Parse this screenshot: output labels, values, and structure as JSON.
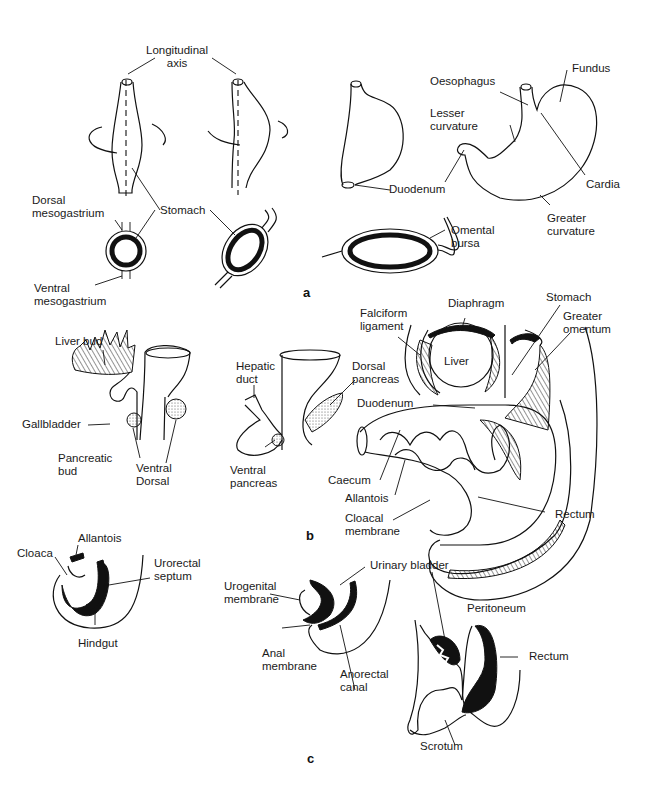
{
  "figure": {
    "panels": [
      {
        "id": "a",
        "label": "a",
        "topic": "Rotation of the stomach",
        "labels": {
          "longitudinal_axis": "Longitudinal\naxis",
          "stomach": "Stomach",
          "dorsal_mesogastrium": "Dorsal\nmesogastrium",
          "ventral_mesogastrium": "Ventral\nmesogastrium",
          "duodenum": "Duodenum",
          "omental_bursa": "Omental\nbursa",
          "oesophagus": "Oesophagus",
          "fundus": "Fundus",
          "lesser_curvature": "Lesser\ncurvature",
          "cardia": "Cardia",
          "greater_curvature": "Greater\ncurvature"
        }
      },
      {
        "id": "b",
        "label": "b",
        "topic": "Liver, pancreas and midgut development",
        "labels": {
          "liver_bud": "Liver bud",
          "gallbladder": "Gallbladder",
          "pancreatic_bud": "Pancreatic\nbud",
          "ventral_dorsal": "Ventral\nDorsal",
          "hepatic_duct": "Hepatic\nduct",
          "ventral_pancreas": "Ventral\npancreas",
          "dorsal_pancreas": "Dorsal\npancreas",
          "falciform_ligament": "Falciform\nligament",
          "diaphragm": "Diaphragm",
          "stomach": "Stomach",
          "greater_omentum": "Greater\nomentum",
          "liver": "Liver",
          "duodenum": "Duodenum",
          "caecum": "Caecum",
          "allantois": "Allantois",
          "cloacal_membrane": "Cloacal\nmembrane",
          "rectum": "Rectum"
        }
      },
      {
        "id": "c",
        "label": "c",
        "topic": "Division of the cloaca",
        "labels": {
          "allantois": "Allantois",
          "cloaca": "Cloaca",
          "urorectal_septum": "Urorectal\nseptum",
          "hindgut": "Hindgut",
          "urogenital_membrane": "Urogenital\nmembrane",
          "urinary_bladder": "Urinary bladder",
          "anal_membrane": "Anal\nmembrane",
          "anorectal_canal": "Anorectal\ncanal",
          "peritoneum": "Peritoneum",
          "rectum": "Rectum",
          "scrotum": "Scrotum"
        }
      }
    ]
  }
}
